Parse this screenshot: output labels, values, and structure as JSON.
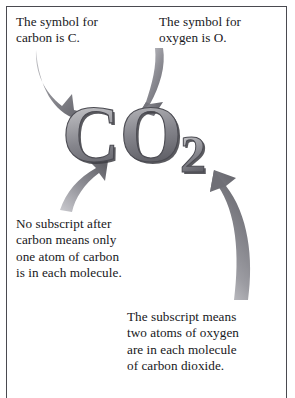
{
  "page": {
    "background_color": "#ffffff",
    "border_color": "#4a4a50",
    "text_color": "#17171b"
  },
  "formula": {
    "full_text": "CO2",
    "carbon_symbol": "C",
    "oxygen_symbol": "O",
    "oxygen_subscript": "2",
    "fill_light": "#d8d8da",
    "fill_mid": "#9a9a9e",
    "fill_dark": "#56565c",
    "outline_color": "#3f3f45"
  },
  "captions": {
    "carbon": "The symbol for\ncarbon is C.",
    "oxygen": "The symbol for\noxygen is O.",
    "no_subscript": "No subscript after\ncarbon means only\none atom of carbon\nis in each molecule.",
    "subscript": "The subscript means\ntwo atoms of oxygen\nare in each molecule\nof carbon dioxide."
  },
  "arrows": {
    "fill_light": "#cfcfd2",
    "fill_dark": "#6e6e74",
    "items": [
      {
        "name": "arrow-carbon-label-to-c",
        "from": "The symbol for carbon is C.",
        "to": "C",
        "direction": "down-right"
      },
      {
        "name": "arrow-oxygen-label-to-o",
        "from": "The symbol for oxygen is O.",
        "to": "O",
        "direction": "down"
      },
      {
        "name": "arrow-nosubscript-to-c",
        "from": "No subscript after carbon means only one atom of carbon is in each molecule.",
        "to": "C",
        "direction": "up-right"
      },
      {
        "name": "arrow-subscript-to-2",
        "from": "The subscript means two atoms of oxygen are in each molecule of carbon dioxide.",
        "to": "2",
        "direction": "up-left"
      }
    ]
  }
}
